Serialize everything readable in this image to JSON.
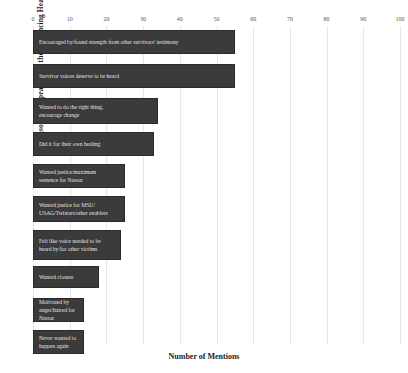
{
  "chart_data": {
    "type": "bar",
    "orientation": "horizontal",
    "title": "",
    "xlabel": "Number of Mentions",
    "ylabel": "Reasons for Speaking at the Sentencing Hearing",
    "xlim": [
      0,
      100
    ],
    "xticks": [
      0,
      10,
      20,
      30,
      40,
      50,
      60,
      70,
      80,
      90,
      100
    ],
    "grid": true,
    "legend": false,
    "bar_color": "#3b3b3b",
    "label_color": "#f2f2f2",
    "categories": [
      "Encouraged by/found strength from other survivors' testimony",
      "Survivor voices deserve to be heard",
      "Wanted to do the right thing,\nencourage change",
      "Did it for their own healing",
      "Wanted justice/maximum\nsentence for Nassar",
      "Wanted justice for MSU/\nUSAG/Twistars/other enablers",
      "Felt like voice needed to be\nheard by/for other victims",
      "Wanted closure",
      "Motivated by\nanger/hatred for Nassar",
      "Never wanted to\nhappen again"
    ],
    "values": [
      55,
      55,
      34,
      33,
      25,
      25,
      24,
      18,
      14,
      14
    ]
  }
}
